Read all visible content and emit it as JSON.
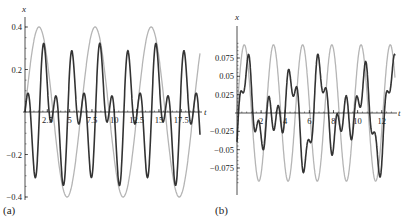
{
  "chart_data": [
    {
      "panel": "(a)",
      "type": "line",
      "xlabel": "t",
      "ylabel": "x",
      "xlim": [
        0,
        19.5
      ],
      "ylim": [
        -0.4,
        0.4
      ],
      "x_ticks": [
        2.5,
        5,
        7.5,
        10,
        12.5,
        15,
        17.5
      ],
      "x_tick_labels": [
        "2.5",
        "5",
        "7.5",
        "10",
        "12.5",
        "15",
        "17.5"
      ],
      "y_ticks": [
        0.4,
        0.2,
        -0.2,
        -0.4
      ],
      "y_tick_labels": [
        "0.4",
        "0.2",
        "−0.2",
        "−0.4"
      ],
      "grid": false,
      "series": [
        {
          "name": "envelope",
          "color": "#b5b5b5",
          "description": "x = 0.4 sin(t)",
          "amplitude": 0.4,
          "period": 6.28
        },
        {
          "name": "response",
          "color": "#333333",
          "description": "modulated oscillation, peaks 0.4 at t≈3.8, 9.9, 16.3; secondary peaks ≈0.14; troughs ≈−0.32",
          "amplitude": 0.4,
          "period": 6.28
        }
      ]
    },
    {
      "panel": "(b)",
      "type": "line",
      "xlabel": "t",
      "ylabel": "x",
      "xlim": [
        0,
        13
      ],
      "ylim": [
        -0.095,
        0.095
      ],
      "x_ticks": [
        2,
        4,
        6,
        8,
        10,
        12
      ],
      "x_tick_labels": [
        "2",
        "4",
        "6",
        "8",
        "10",
        "12"
      ],
      "y_ticks": [
        0.075,
        0.05,
        0.025,
        -0.025,
        -0.05,
        -0.075
      ],
      "y_tick_labels": [
        "0.075",
        "0.05",
        "0.025",
        "−0.025",
        "−0.05",
        "−0.075"
      ],
      "grid": false,
      "series": [
        {
          "name": "envelope",
          "color": "#b5b5b5",
          "description": "x ≈ 0.093 sin(2.6 t)",
          "amplitude": 0.093,
          "period": 2.42
        },
        {
          "name": "response",
          "color": "#333333",
          "description": "oscillation with peaks ≈0.093 and ≈0.065, troughs ≈−0.088 and ≈−0.035",
          "amplitude": 0.093,
          "period": 2.42
        }
      ]
    }
  ],
  "labels": {
    "panel_a": "(a)",
    "panel_b": "(b)",
    "axis_x": "t",
    "axis_y": "x"
  }
}
